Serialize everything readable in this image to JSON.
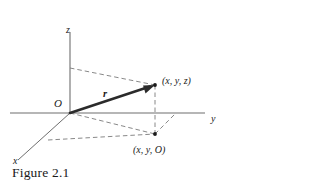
{
  "figure": {
    "caption": "Figure 2.1",
    "background_color": "#ffffff",
    "line_color": "#6e6e6e",
    "dashed_color": "#7a7a7a",
    "vector_color": "#2b2b2b",
    "text_color": "#1a1a1a",
    "axes": [
      {
        "name": "z-axis",
        "label": "z",
        "label_x": 66,
        "label_y": 33
      },
      {
        "name": "y-axis",
        "label": "y",
        "label_x": 211,
        "label_y": 122
      },
      {
        "name": "x-axis",
        "label": "x",
        "label_x": 13,
        "label_y": 164
      }
    ],
    "origin": {
      "label": "O",
      "label_x": 54,
      "label_y": 107,
      "x": 70,
      "y": 113
    },
    "vector": {
      "label": "r",
      "label_x": 103,
      "label_y": 97,
      "from_x": 70,
      "from_y": 113,
      "to_x": 155,
      "to_y": 85
    },
    "points": [
      {
        "name": "point-xyz",
        "label": "(x, y, z)",
        "x": 155,
        "y": 85,
        "label_x": 162,
        "label_y": 84
      },
      {
        "name": "point-xy0",
        "label": "(x, y, O)",
        "x": 155,
        "y": 134,
        "label_x": 133,
        "label_y": 153
      }
    ]
  }
}
